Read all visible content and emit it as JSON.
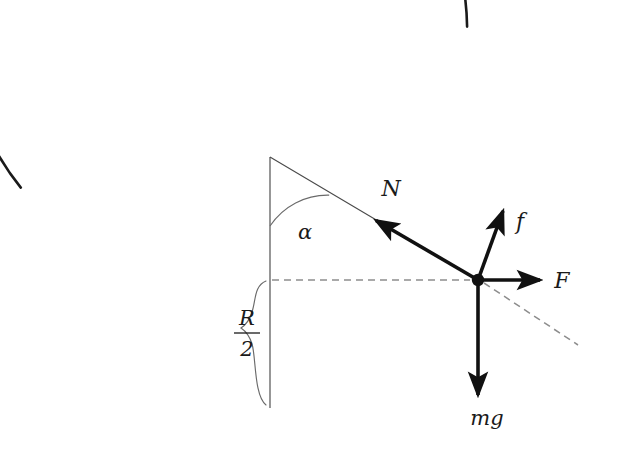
{
  "figure": {
    "type": "physics-force-diagram",
    "background_color": "#ffffff",
    "stroke_color": "#1a1a1a",
    "thin_stroke_color": "#555555",
    "dashed_color": "#888888"
  },
  "labels": {
    "normal_force": "N",
    "friction_force": "f",
    "applied_force": "F",
    "weight": "mg",
    "angle": "α",
    "radius_numerator": "R",
    "radius_denominator": "2"
  },
  "geometry": {
    "center": {
      "x": 270,
      "y": 157
    },
    "radius": 251,
    "contact_point": {
      "x": 478,
      "y": 280
    },
    "bowl_bottom": {
      "x": 270,
      "y": 408
    },
    "arc_start_angle_deg": 173,
    "arc_end_angle_deg": 329,
    "angle_alpha_deg": 31
  },
  "vectors": [
    {
      "name": "normal-force",
      "label": "N",
      "from": {
        "x": 478,
        "y": 280
      },
      "to": {
        "x": 372,
        "y": 218
      },
      "description": "normal force pointing from contact point toward the circle center"
    },
    {
      "name": "friction-force",
      "label": "f",
      "from": {
        "x": 478,
        "y": 280
      },
      "to": {
        "x": 502,
        "y": 205
      },
      "description": "friction force tangent to the surface, directed up-slope"
    },
    {
      "name": "applied-force",
      "label": "F",
      "from": {
        "x": 478,
        "y": 280
      },
      "to": {
        "x": 545,
        "y": 280
      },
      "description": "horizontal applied force pointing right"
    },
    {
      "name": "weight-force",
      "label": "mg",
      "from": {
        "x": 478,
        "y": 280
      },
      "to": {
        "x": 478,
        "y": 400
      },
      "description": "weight pointing vertically downward"
    }
  ],
  "guides": [
    {
      "name": "horizontal-dashed-guide",
      "style": "dashed",
      "from": {
        "x": 272,
        "y": 280
      },
      "to": {
        "x": 478,
        "y": 280
      }
    },
    {
      "name": "tangent-dashed-guide",
      "style": "dashed",
      "from": {
        "x": 478,
        "y": 280
      },
      "to": {
        "x": 578,
        "y": 345
      }
    },
    {
      "name": "vertical-center-line",
      "style": "solid-thin",
      "from": {
        "x": 270,
        "y": 157
      },
      "to": {
        "x": 270,
        "y": 408
      }
    },
    {
      "name": "radius-line",
      "style": "solid-thin",
      "from": {
        "x": 270,
        "y": 157
      },
      "to": {
        "x": 478,
        "y": 280
      }
    }
  ],
  "label_positions": {
    "normal_force": {
      "x": 391,
      "y": 196
    },
    "friction_force": {
      "x": 520,
      "y": 229
    },
    "applied_force": {
      "x": 562,
      "y": 288
    },
    "weight": {
      "x": 483,
      "y": 425
    },
    "angle": {
      "x": 305,
      "y": 237
    },
    "radius_fraction": {
      "x": 247,
      "y": 336
    }
  }
}
